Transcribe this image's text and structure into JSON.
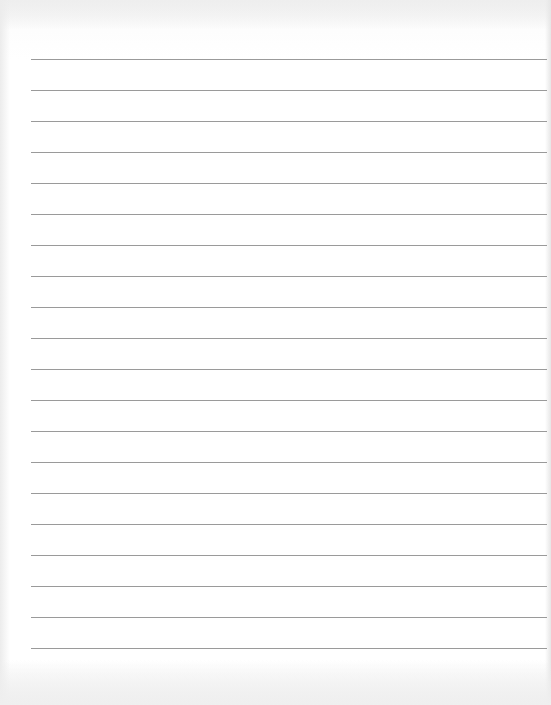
{
  "page": {
    "type": "lined-paper",
    "background_color": "#ffffff",
    "rule_color": "#9a9a9a",
    "rule_count": 20,
    "rule_left_px": 31,
    "first_rule_y_px": 59,
    "rule_spacing_px": 31
  }
}
